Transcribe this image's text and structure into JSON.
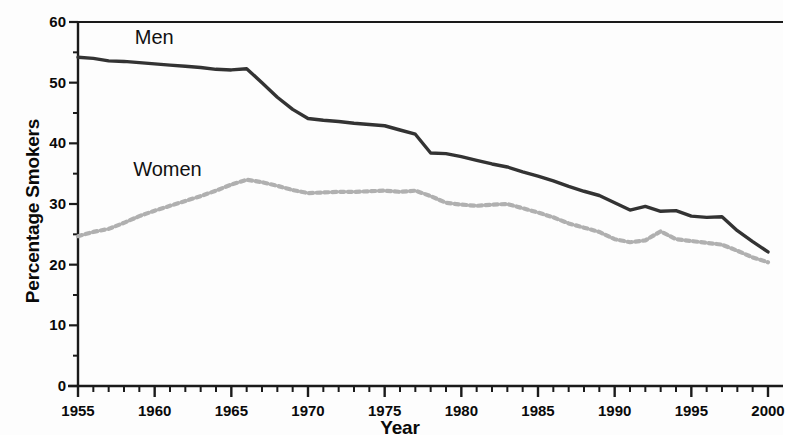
{
  "chart_data": {
    "type": "line",
    "title": "",
    "xlabel": "Year",
    "ylabel": "Percentage Smokers",
    "xlim": [
      1955,
      2000
    ],
    "ylim": [
      0,
      60
    ],
    "xticks": [
      1955,
      1960,
      1965,
      1970,
      1975,
      1980,
      1985,
      1990,
      1995,
      2000
    ],
    "xtick_labels": [
      "1955",
      "1960",
      "1965",
      "1970",
      "1975",
      "1980",
      "1985",
      "1990",
      "1995",
      "2000"
    ],
    "x_minor_tick_step": 1,
    "yticks": [
      0,
      10,
      20,
      30,
      40,
      50,
      60
    ],
    "ytick_labels": [
      "0",
      "10",
      "20",
      "30",
      "40",
      "50",
      "60"
    ],
    "y_minor_tick_step": 5,
    "grid": false,
    "legend_position": "inline-annotations",
    "series": [
      {
        "name": "Men",
        "style": "solid",
        "color": "#333333",
        "label_annotation": "Men",
        "x": [
          1955,
          1956,
          1957,
          1958,
          1959,
          1960,
          1961,
          1962,
          1963,
          1964,
          1965,
          1966,
          1967,
          1968,
          1969,
          1970,
          1971,
          1972,
          1973,
          1974,
          1975,
          1976,
          1977,
          1978,
          1979,
          1980,
          1981,
          1982,
          1983,
          1984,
          1985,
          1986,
          1987,
          1988,
          1989,
          1990,
          1991,
          1992,
          1993,
          1994,
          1995,
          1996,
          1997,
          1998,
          1999,
          2000
        ],
        "values": [
          54.2,
          54.0,
          53.6,
          53.5,
          53.3,
          53.1,
          52.9,
          52.7,
          52.5,
          52.2,
          52.1,
          52.3,
          50.0,
          47.6,
          45.6,
          44.1,
          43.8,
          43.6,
          43.3,
          43.1,
          42.9,
          42.2,
          41.5,
          38.4,
          38.3,
          37.8,
          37.2,
          36.6,
          36.1,
          35.3,
          34.6,
          33.8,
          32.9,
          32.1,
          31.4,
          30.2,
          29.0,
          29.6,
          28.8,
          28.9,
          28.0,
          27.8,
          27.9,
          25.6,
          23.8,
          22.1
        ]
      },
      {
        "name": "Women",
        "style": "dotted",
        "color": "#b0b0b0",
        "label_annotation": "Women",
        "x": [
          1955,
          1956,
          1957,
          1958,
          1959,
          1960,
          1961,
          1962,
          1963,
          1964,
          1965,
          1966,
          1967,
          1968,
          1969,
          1970,
          1971,
          1972,
          1973,
          1974,
          1975,
          1976,
          1977,
          1978,
          1979,
          1980,
          1981,
          1982,
          1983,
          1984,
          1985,
          1986,
          1987,
          1988,
          1989,
          1990,
          1991,
          1992,
          1993,
          1994,
          1995,
          1996,
          1997,
          1998,
          1999,
          2000
        ],
        "values": [
          24.7,
          25.4,
          25.9,
          26.9,
          28.0,
          28.9,
          29.7,
          30.5,
          31.3,
          32.2,
          33.2,
          34.0,
          33.6,
          33.0,
          32.3,
          31.8,
          31.9,
          32.0,
          32.0,
          32.1,
          32.2,
          32.0,
          32.2,
          31.3,
          30.2,
          29.9,
          29.7,
          29.9,
          30.0,
          29.3,
          28.6,
          27.8,
          26.8,
          26.1,
          25.4,
          24.2,
          23.7,
          24.0,
          25.5,
          24.2,
          23.9,
          23.6,
          23.3,
          22.3,
          21.2,
          20.4
        ]
      }
    ],
    "annotations": [
      {
        "text": "Men",
        "x": 1958.7,
        "y": 57.2
      },
      {
        "text": "Women",
        "x": 1958.6,
        "y": 35.4
      }
    ]
  }
}
